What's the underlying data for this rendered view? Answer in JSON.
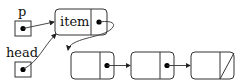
{
  "diagram": {
    "type": "linked-list",
    "pointers": [
      {
        "label": "p",
        "points_to": "item"
      },
      {
        "label": "head",
        "points_to": "item"
      }
    ],
    "nodes": [
      {
        "id": "item",
        "data_label": "item",
        "next": "node2"
      },
      {
        "id": "node2",
        "data_label": "",
        "next": "node3"
      },
      {
        "id": "node3",
        "data_label": "",
        "next": "node4"
      },
      {
        "id": "node4",
        "data_label": "",
        "next": null,
        "null_marker": "diagonal-slash"
      }
    ],
    "colors": {
      "stroke": "#333333",
      "fill": "#ffffff",
      "dot": "#000000"
    }
  }
}
